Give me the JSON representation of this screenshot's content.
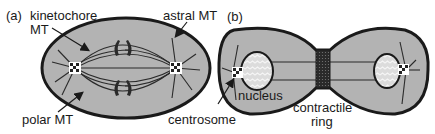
{
  "figure": {
    "panels": [
      {
        "id": "a",
        "label": "(a)",
        "title": "metaphase spindle",
        "annotations": {
          "kinetochore_line1": "kinetochore",
          "kinetochore_line2": "MT",
          "astral": "astral MT",
          "polar": "polar MT"
        }
      },
      {
        "id": "b",
        "label": "(b)",
        "title": "cytokinesis",
        "annotations": {
          "centrosome": "centrosome",
          "nucleus": "nucleus",
          "ring_line1": "contractile",
          "ring_line2": "ring"
        }
      }
    ],
    "colors": {
      "cell_fill": "#b3b3b3",
      "outline": "#1a1a1a",
      "text": "#1a1a1a",
      "nucleus_fill": "#d6d6d6",
      "background": "#ffffff"
    }
  }
}
